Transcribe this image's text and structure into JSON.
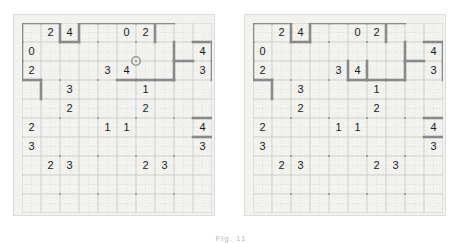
{
  "figure": {
    "caption": "Fig. 11",
    "panel_count": 2,
    "grid_rows": 10,
    "grid_cols": 10
  },
  "colors": {
    "page_background": "#ffffff",
    "board_background": "#f2f2f0",
    "board_border": "#dcdcd8",
    "cell_line": "#cfcfc9",
    "subgrid_dot": "#e2e2dd",
    "wall": "#8a8a8a",
    "digit": "#1c1c1c",
    "vertex_dot": "#7a7a7a",
    "cursor_ring": "#9a9a9a",
    "caption_text": "#b9b9b6"
  },
  "geometry": {
    "cell_size": 19,
    "grid_origin_x": 0,
    "grid_origin_y": 0,
    "grid_pixels": 190
  },
  "panels": [
    {
      "id": "left",
      "name": "before-state",
      "has_cursor": true,
      "cursor": {
        "col": 6,
        "row": 2,
        "label": "vertex-cursor"
      },
      "clues": [
        {
          "row": 0,
          "col": 1,
          "value": "2"
        },
        {
          "row": 0,
          "col": 2,
          "value": "4"
        },
        {
          "row": 0,
          "col": 5,
          "value": "0"
        },
        {
          "row": 0,
          "col": 6,
          "value": "2"
        },
        {
          "row": 1,
          "col": 0,
          "value": "0"
        },
        {
          "row": 1,
          "col": 9,
          "value": "4"
        },
        {
          "row": 2,
          "col": 0,
          "value": "2"
        },
        {
          "row": 2,
          "col": 4,
          "value": "3"
        },
        {
          "row": 2,
          "col": 5,
          "value": "4"
        },
        {
          "row": 2,
          "col": 9,
          "value": "3"
        },
        {
          "row": 3,
          "col": 2,
          "value": "3"
        },
        {
          "row": 3,
          "col": 6,
          "value": "1"
        },
        {
          "row": 4,
          "col": 2,
          "value": "2"
        },
        {
          "row": 4,
          "col": 6,
          "value": "2"
        },
        {
          "row": 5,
          "col": 0,
          "value": "2"
        },
        {
          "row": 5,
          "col": 4,
          "value": "1"
        },
        {
          "row": 5,
          "col": 5,
          "value": "1"
        },
        {
          "row": 5,
          "col": 9,
          "value": "4"
        },
        {
          "row": 6,
          "col": 0,
          "value": "3"
        },
        {
          "row": 6,
          "col": 9,
          "value": "3"
        },
        {
          "row": 7,
          "col": 1,
          "value": "2"
        },
        {
          "row": 7,
          "col": 2,
          "value": "3"
        },
        {
          "row": 7,
          "col": 6,
          "value": "2"
        },
        {
          "row": 7,
          "col": 7,
          "value": "3"
        }
      ],
      "walls_h": [
        {
          "row": 0,
          "col": 0
        },
        {
          "row": 0,
          "col": 1
        },
        {
          "row": 0,
          "col": 3
        },
        {
          "row": 0,
          "col": 4
        },
        {
          "row": 0,
          "col": 5
        },
        {
          "row": 0,
          "col": 6
        },
        {
          "row": 0,
          "col": 7
        },
        {
          "row": 1,
          "col": 2
        },
        {
          "row": 1,
          "col": 9
        },
        {
          "row": 2,
          "col": 8
        },
        {
          "row": 3,
          "col": 0
        },
        {
          "row": 3,
          "col": 5
        },
        {
          "row": 3,
          "col": 6
        },
        {
          "row": 3,
          "col": 7
        },
        {
          "row": 5,
          "col": 9
        },
        {
          "row": 6,
          "col": 9
        }
      ],
      "walls_v": [
        {
          "row": 0,
          "col": 0
        },
        {
          "row": 1,
          "col": 0
        },
        {
          "row": 2,
          "col": 0
        },
        {
          "row": 0,
          "col": 2
        },
        {
          "row": 0,
          "col": 3
        },
        {
          "row": 0,
          "col": 7
        },
        {
          "row": 1,
          "col": 8
        },
        {
          "row": 1,
          "col": 10
        },
        {
          "row": 2,
          "col": 10
        },
        {
          "row": 2,
          "col": 8
        },
        {
          "row": 3,
          "col": 1
        }
      ]
    },
    {
      "id": "right",
      "name": "after-state",
      "has_cursor": false,
      "cursor": null,
      "clues": [
        {
          "row": 0,
          "col": 1,
          "value": "2"
        },
        {
          "row": 0,
          "col": 2,
          "value": "4"
        },
        {
          "row": 0,
          "col": 5,
          "value": "0"
        },
        {
          "row": 0,
          "col": 6,
          "value": "2"
        },
        {
          "row": 1,
          "col": 0,
          "value": "0"
        },
        {
          "row": 1,
          "col": 9,
          "value": "4"
        },
        {
          "row": 2,
          "col": 0,
          "value": "2"
        },
        {
          "row": 2,
          "col": 4,
          "value": "3"
        },
        {
          "row": 2,
          "col": 5,
          "value": "4"
        },
        {
          "row": 2,
          "col": 9,
          "value": "3"
        },
        {
          "row": 3,
          "col": 2,
          "value": "3"
        },
        {
          "row": 3,
          "col": 6,
          "value": "1"
        },
        {
          "row": 4,
          "col": 2,
          "value": "2"
        },
        {
          "row": 4,
          "col": 6,
          "value": "2"
        },
        {
          "row": 5,
          "col": 0,
          "value": "2"
        },
        {
          "row": 5,
          "col": 4,
          "value": "1"
        },
        {
          "row": 5,
          "col": 5,
          "value": "1"
        },
        {
          "row": 5,
          "col": 9,
          "value": "4"
        },
        {
          "row": 6,
          "col": 0,
          "value": "3"
        },
        {
          "row": 6,
          "col": 9,
          "value": "3"
        },
        {
          "row": 7,
          "col": 1,
          "value": "2"
        },
        {
          "row": 7,
          "col": 2,
          "value": "3"
        },
        {
          "row": 7,
          "col": 6,
          "value": "2"
        },
        {
          "row": 7,
          "col": 7,
          "value": "3"
        }
      ],
      "walls_h": [
        {
          "row": 0,
          "col": 0
        },
        {
          "row": 0,
          "col": 1
        },
        {
          "row": 0,
          "col": 3
        },
        {
          "row": 0,
          "col": 4
        },
        {
          "row": 0,
          "col": 5
        },
        {
          "row": 0,
          "col": 6
        },
        {
          "row": 0,
          "col": 7
        },
        {
          "row": 1,
          "col": 2
        },
        {
          "row": 1,
          "col": 9
        },
        {
          "row": 2,
          "col": 8
        },
        {
          "row": 3,
          "col": 0
        },
        {
          "row": 3,
          "col": 5
        },
        {
          "row": 3,
          "col": 6
        },
        {
          "row": 3,
          "col": 7
        },
        {
          "row": 5,
          "col": 9
        },
        {
          "row": 6,
          "col": 9
        }
      ],
      "walls_v": [
        {
          "row": 0,
          "col": 0
        },
        {
          "row": 1,
          "col": 0
        },
        {
          "row": 2,
          "col": 0
        },
        {
          "row": 0,
          "col": 2
        },
        {
          "row": 0,
          "col": 3
        },
        {
          "row": 0,
          "col": 7
        },
        {
          "row": 1,
          "col": 8
        },
        {
          "row": 1,
          "col": 10
        },
        {
          "row": 2,
          "col": 10
        },
        {
          "row": 2,
          "col": 8
        },
        {
          "row": 3,
          "col": 1
        },
        {
          "row": 2,
          "col": 5
        },
        {
          "row": 2,
          "col": 6
        }
      ]
    }
  ]
}
